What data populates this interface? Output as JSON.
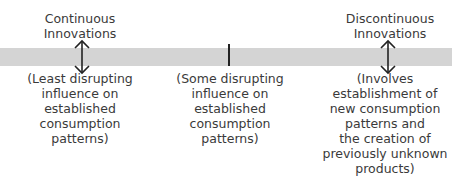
{
  "diagram": {
    "band_color": "#d4d4d4",
    "left": {
      "title": "Continuous\nInnovations",
      "description": "(Least disrupting\ninfluence on\nestablished\nconsumption\npatterns)"
    },
    "middle": {
      "description": "(Some disrupting\ninfluence on\nestablished\nconsumption\npatterns)"
    },
    "right": {
      "title": "Discontinuous\nInnovations",
      "description": "(Involves\nestablishment of\nnew consumption\npatterns and\nthe creation of\npreviously unknown\nproducts)"
    }
  }
}
